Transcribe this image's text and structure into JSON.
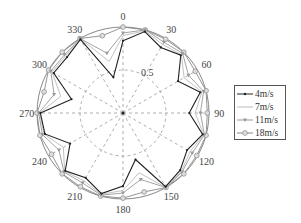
{
  "chart_data": {
    "type": "polar-line",
    "title": "",
    "angle_ticks": [
      "0",
      "30",
      "60",
      "90",
      "120",
      "150",
      "180",
      "210",
      "240",
      "270",
      "300",
      "330"
    ],
    "radial_ticks": [
      "0.5"
    ],
    "rlim": [
      0,
      1
    ],
    "angles_deg": [
      0,
      15,
      30,
      45,
      60,
      75,
      90,
      105,
      120,
      135,
      150,
      165,
      180,
      195,
      210,
      225,
      240,
      255,
      270,
      285,
      300,
      315,
      330,
      345
    ],
    "series": [
      {
        "name": "4m/s",
        "color": "#222222",
        "marker": "dot",
        "values": [
          0.84,
          0.98,
          0.88,
          0.95,
          0.74,
          0.93,
          0.77,
          0.96,
          0.86,
          0.94,
          0.99,
          0.56,
          0.85,
          0.97,
          0.87,
          0.95,
          0.71,
          0.94,
          0.96,
          0.62,
          0.93,
          0.92,
          0.99,
          0.43
        ]
      },
      {
        "name": "7m/s",
        "color": "#bbbbbb",
        "marker": "none",
        "values": [
          0.9,
          0.99,
          0.92,
          0.96,
          0.82,
          0.95,
          0.84,
          0.97,
          0.9,
          0.96,
          1.0,
          0.72,
          0.9,
          0.98,
          0.91,
          0.96,
          0.8,
          0.95,
          0.97,
          0.75,
          0.95,
          0.94,
          1.0,
          0.62
        ]
      },
      {
        "name": "11m/s",
        "color": "#999999",
        "marker": "triangle",
        "values": [
          0.93,
          1.0,
          0.95,
          0.98,
          0.88,
          0.97,
          0.9,
          0.98,
          0.93,
          0.97,
          1.0,
          0.8,
          0.93,
          0.99,
          0.94,
          0.97,
          0.86,
          0.97,
          0.98,
          0.83,
          0.97,
          0.96,
          1.0,
          0.72
        ]
      },
      {
        "name": "18m/s",
        "color": "#888888",
        "marker": "circle",
        "values": [
          1.0,
          1.0,
          0.99,
          1.0,
          0.97,
          1.0,
          0.98,
          1.0,
          0.99,
          1.0,
          1.0,
          0.95,
          0.99,
          1.0,
          0.99,
          1.0,
          0.96,
          1.0,
          1.0,
          0.95,
          1.0,
          1.0,
          1.0,
          0.93
        ]
      }
    ],
    "legend_position": "right",
    "grid": true
  }
}
